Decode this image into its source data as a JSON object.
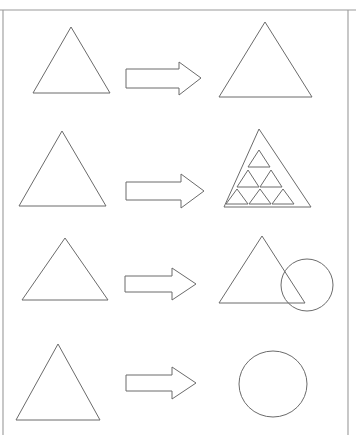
{
  "page": {
    "width": 356,
    "height": 435,
    "background_color": "#ffffff",
    "stroke_color": "#6b6b6b",
    "frame_color": "#9a9a9a"
  },
  "frame": {
    "top_rule": {
      "name": "top-border-line",
      "x1": 0,
      "y1": 10,
      "x2": 356,
      "y2": 10
    },
    "left_rule": {
      "name": "left-border-line",
      "x1": 3,
      "y1": 10,
      "x2": 3,
      "y2": 435
    },
    "right_rule": {
      "name": "right-border-line",
      "x1": 348,
      "y1": 10,
      "x2": 348,
      "y2": 435
    }
  },
  "rows": [
    {
      "index": 1,
      "label": "row-1-triangle-to-larger-triangle",
      "left": {
        "type": "triangle",
        "label": "small triangle",
        "points": "71,27 110,93 33,93"
      },
      "arrow": {
        "type": "block-arrow-right",
        "label": "transforms into",
        "points": "126,69 179,69 179,62 201,78 179,95 179,88 126,88"
      },
      "right": {
        "type": "triangle",
        "label": "large triangle",
        "points": "265,22 312,97 219,97"
      }
    },
    {
      "index": 2,
      "label": "row-2-triangle-to-subdivided-triangle",
      "left": {
        "type": "triangle",
        "label": "plain triangle",
        "points": "62,131 106,206 19,206"
      },
      "arrow": {
        "type": "block-arrow-right",
        "label": "transforms into",
        "points": "126,182 181,182 181,174 204,191 181,208 181,200 126,200"
      },
      "right": {
        "type": "triangle-with-inner-triangles",
        "label": "triangle containing six small triangles",
        "outer_points": "259,129 311,207 224,207",
        "inner_count": 6,
        "inner_triangles": [
          "259,150 270,167 248,167",
          "248,170 259,187 237,187",
          "271,170 282,187 260,187",
          "237,189 248,204 226,204",
          "260,189 271,204 249,204",
          "283,189 294,204 272,204"
        ]
      }
    },
    {
      "index": 3,
      "label": "row-3-triangle-to-triangle-and-circle",
      "left": {
        "type": "triangle",
        "label": "plain triangle",
        "points": "65,238 108,300 22,300"
      },
      "arrow": {
        "type": "block-arrow-right",
        "label": "transforms into",
        "points": "125,276 172,276 172,268 196,284 172,300 172,292 125,292"
      },
      "right": {
        "type": "triangle-overlapping-circle",
        "label": "triangle overlapping a circle",
        "triangle_points": "262,236 305,303 219,303",
        "circle": {
          "cx": 307,
          "cy": 285,
          "r": 26
        }
      }
    },
    {
      "index": 4,
      "label": "row-4-triangle-to-circle",
      "left": {
        "type": "triangle",
        "label": "plain triangle",
        "points": "58,344 100,420 16,420"
      },
      "arrow": {
        "type": "block-arrow-right",
        "label": "transforms into",
        "points": "126,375 172,375 172,367 196,383 172,399 172,391 126,391"
      },
      "right": {
        "type": "ellipse",
        "label": "circle",
        "ellipse": {
          "cx": 273,
          "cy": 384,
          "rx": 34,
          "ry": 33
        }
      }
    }
  ]
}
